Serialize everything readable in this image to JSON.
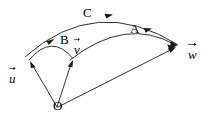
{
  "figure": {
    "kind": "vector-diagram",
    "background_color": "#ffffff",
    "stroke_color": "#1a1a1a",
    "text_color": "#000000",
    "width": 207,
    "height": 123
  },
  "points": {
    "origin": {
      "label": "O",
      "x": 57,
      "y": 108
    }
  },
  "vectors": [
    {
      "id": "u",
      "label": "u",
      "label_x": 9,
      "label_y": 66,
      "tip_x": 30,
      "tip_y": 62
    },
    {
      "id": "v",
      "label": "v",
      "label_x": 74,
      "label_y": 37,
      "tip_x": 73,
      "tip_y": 61
    },
    {
      "id": "w",
      "label": "w",
      "label_x": 188,
      "label_y": 42,
      "tip_x": 176,
      "tip_y": 47
    }
  ],
  "arcs": [
    {
      "id": "B",
      "label": "B",
      "label_x": 60,
      "label_y": 33,
      "from": "u",
      "to": "v"
    },
    {
      "id": "A",
      "label": "A",
      "label_x": 130,
      "label_y": 22,
      "from": "v",
      "to": "w"
    },
    {
      "id": "C",
      "label": "C",
      "label_x": 83,
      "label_y": 6,
      "from": "u",
      "to": "w"
    }
  ]
}
